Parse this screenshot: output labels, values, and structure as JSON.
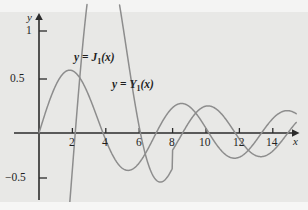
{
  "figure": {
    "background_color": "#e8e8e6",
    "ink_color": "#2b2b2b",
    "curve_color": "#8d8d8d"
  },
  "axes": {
    "x_axis_name": "x",
    "y_axis_name": "y",
    "x_ticks": [
      {
        "value": 2,
        "label": "2"
      },
      {
        "value": 4,
        "label": "4"
      },
      {
        "value": 6,
        "label": "6"
      },
      {
        "value": 8,
        "label": "8"
      },
      {
        "value": 10,
        "label": "10"
      },
      {
        "value": 12,
        "label": "12"
      },
      {
        "value": 14,
        "label": "14"
      }
    ],
    "y_ticks": [
      {
        "value": 1,
        "label": "1"
      },
      {
        "value": 0.5,
        "label": "0.5"
      },
      {
        "value": -0.5,
        "label": "−0.5"
      }
    ]
  },
  "annotations": [
    {
      "id": "label-j1",
      "text_prefix": "y",
      "text_eq": " = ",
      "fn": "J",
      "sub": "1",
      "arg": "(x)",
      "x": 1.9,
      "y": 0.72
    },
    {
      "id": "label-y1",
      "text_prefix": "y",
      "text_eq": " = ",
      "fn": "Y",
      "sub": "1",
      "arg": "(x)",
      "x": 3.6,
      "y": 0.45
    }
  ],
  "chart_data": {
    "type": "line",
    "title": "",
    "xlabel": "x",
    "ylabel": "y",
    "xlim": [
      0,
      15.4
    ],
    "ylim": [
      -0.72,
      1.15
    ],
    "grid": false,
    "legend_position": "inline-annotations",
    "x_ticks": [
      2,
      4,
      6,
      8,
      10,
      12,
      14
    ],
    "y_ticks": [
      1,
      0.5,
      -0.5
    ],
    "series": [
      {
        "name": "y = J_1(x)",
        "label_text": "y = J1(x)",
        "color": "#8d8d8d",
        "domain": [
          0,
          15.4
        ],
        "key_points": {
          "zeros": [
            0,
            3.832,
            7.016,
            10.174,
            13.324
          ],
          "maxima": [
            {
              "x": 1.841,
              "y": 0.5819
            },
            {
              "x": 8.536,
              "y": 0.2731
            },
            {
              "x": 14.864,
              "y": 0.2065
            }
          ],
          "minima": [
            {
              "x": 5.331,
              "y": -0.3461
            },
            {
              "x": 11.706,
              "y": -0.2333
            }
          ]
        },
        "samples_x": [
          0,
          0.5,
          1,
          1.5,
          1.841,
          2.5,
          3,
          3.832,
          4.5,
          5.331,
          6,
          7.016,
          8,
          8.536,
          9,
          10.174,
          11,
          11.706,
          12.5,
          13.324,
          14,
          14.864,
          15.4
        ],
        "samples_y": [
          0,
          0.2423,
          0.4401,
          0.5579,
          0.5819,
          0.4971,
          0.3391,
          0,
          -0.2311,
          -0.3461,
          -0.2767,
          0,
          0.2346,
          0.2731,
          0.2453,
          0,
          -0.1768,
          -0.2333,
          -0.1768,
          0,
          0.1334,
          0.2065,
          0.1813
        ]
      },
      {
        "name": "y = Y_1(x)",
        "label_text": "y = Y1(x)",
        "color": "#8d8d8d",
        "domain": [
          0.36,
          15.4
        ],
        "key_points": {
          "zeros": [
            2.197,
            5.43,
            8.596,
            11.749,
            14.897
          ],
          "maxima": [
            {
              "x": 3.683,
              "y": 0.4159
            },
            {
              "x": 10.124,
              "y": 0.2492
            }
          ],
          "minima": [
            {
              "x": 6.941,
              "y": -0.3027
            },
            {
              "x": 13.285,
              "y": -0.2196
            }
          ]
        },
        "samples_x": [
          0.36,
          0.6,
          1,
          1.5,
          2.197,
          3,
          3.683,
          4.5,
          5.43,
          6.5,
          6.941,
          8,
          8.596,
          9.5,
          10.124,
          11,
          11.749,
          12.5,
          13.285,
          14,
          14.897,
          15.4
        ],
        "samples_y": [
          -1.85,
          -1.26,
          -0.7812,
          -0.4123,
          0,
          0.3247,
          0.4159,
          0.3979,
          0,
          -0.2741,
          -0.3027,
          -0.1581,
          0,
          0.1731,
          0.2492,
          0.1637,
          0,
          -0.1581,
          -0.2196,
          -0.1479,
          0,
          0.1128
        ]
      }
    ]
  }
}
